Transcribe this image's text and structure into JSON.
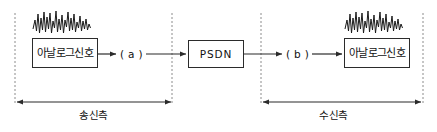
{
  "diagram": {
    "background_color": "#ffffff",
    "line_color": "#2b2b2b",
    "dashed_color": "#8c8c8c",
    "nodes": [
      {
        "id": "analog-source",
        "label": "아날로그신호",
        "x": 32,
        "y": 38,
        "w": 66,
        "h": 30,
        "style": "wide-label"
      },
      {
        "id": "psdn",
        "label": "PSDN",
        "x": 188,
        "y": 40,
        "w": 56,
        "h": 28,
        "style": "mono-label"
      },
      {
        "id": "analog-sink",
        "label": "아날로그신호",
        "x": 344,
        "y": 38,
        "w": 66,
        "h": 30,
        "style": "wide-label"
      }
    ],
    "port_labels": [
      {
        "id": "port-a",
        "label": "( a )",
        "x": 120,
        "y": 49
      },
      {
        "id": "port-b",
        "label": "( b )",
        "x": 286,
        "y": 49
      }
    ],
    "span_labels": [
      {
        "id": "span-transmit",
        "label": "송신측",
        "x": 79,
        "y": 110
      },
      {
        "id": "span-receive",
        "label": "수신측",
        "x": 319,
        "y": 110
      }
    ],
    "boundaries": [
      {
        "id": "boundary-left",
        "x": 15
      },
      {
        "id": "boundary-mid-left",
        "x": 172
      },
      {
        "id": "boundary-mid-right",
        "x": 261
      },
      {
        "id": "boundary-right",
        "x": 423
      }
    ],
    "waveforms": [
      {
        "id": "waveform-source",
        "x": 33,
        "y": 10,
        "w": 58,
        "h": 26
      },
      {
        "id": "waveform-sink",
        "x": 345,
        "y": 10,
        "w": 58,
        "h": 26
      }
    ],
    "connections": [
      {
        "id": "link-source-to-a",
        "from": "analog-source",
        "to": "port-a"
      },
      {
        "id": "link-a-to-psdn",
        "from": "port-a",
        "to": "psdn"
      },
      {
        "id": "link-psdn-to-b",
        "from": "psdn",
        "to": "port-b"
      },
      {
        "id": "link-b-to-sink",
        "from": "port-b",
        "to": "analog-sink"
      }
    ],
    "measures": [
      {
        "id": "measure-transmit",
        "from_x": 16,
        "to_x": 172,
        "y": 102
      },
      {
        "id": "measure-receive",
        "from_x": 262,
        "to_x": 422,
        "y": 102
      }
    ]
  }
}
